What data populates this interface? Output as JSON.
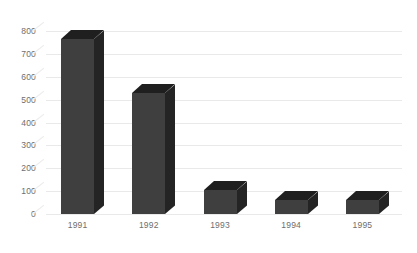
{
  "chart_data": {
    "type": "bar",
    "title": "",
    "subtitle": "",
    "xlabel": "",
    "ylabel": "",
    "categories": [
      "1991",
      "1992",
      "1993",
      "1994",
      "1995"
    ],
    "values": [
      765,
      530,
      105,
      60,
      62
    ],
    "series": [
      {
        "name": "",
        "values": [
          765,
          530,
          105,
          60,
          62
        ]
      }
    ],
    "ylim": [
      0,
      800
    ],
    "ytick_labels": [
      "800",
      "700",
      "600",
      "500",
      "400",
      "300",
      "200",
      "100",
      "0"
    ],
    "ytick_values": [
      800,
      700,
      600,
      500,
      400,
      300,
      200,
      100,
      0
    ],
    "grid": true,
    "legend": false,
    "legend_position": "none",
    "style": "3d-column",
    "annotations": []
  },
  "colors": {
    "bar_front": "#3f3f3f",
    "bar_top": "#1f1f1f",
    "bar_side": "#242424",
    "gridline": "#e9e9e9",
    "tick_text": "#6e6e6e",
    "background": "#ffffff"
  }
}
